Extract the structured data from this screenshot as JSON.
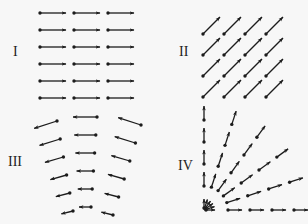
{
  "figure": {
    "ink_color": "#1c1c1c",
    "background_color": "#f7f7f7"
  },
  "panels": [
    {
      "id": "I",
      "label": "I",
      "description": "uniform horizontal field, all vectors pointing right",
      "grid": {
        "cols": 3,
        "rows": 6
      },
      "direction_deg": 0
    },
    {
      "id": "II",
      "label": "II",
      "description": "uniform diagonal field, all vectors pointing up-right",
      "grid": {
        "cols": 4,
        "rows": 4
      },
      "direction_deg": 45
    },
    {
      "id": "III",
      "label": "III",
      "description": "curved field, vectors pointing left and bending, shrinking toward bottom",
      "grid": {
        "cols": 3,
        "rows": 6
      },
      "direction_deg": 180
    },
    {
      "id": "IV",
      "label": "IV",
      "description": "radial field from corner origin, vectors pointing outward",
      "rays_deg": [
        0,
        18,
        36,
        54,
        72,
        90
      ],
      "points_per_ray": 5
    }
  ]
}
